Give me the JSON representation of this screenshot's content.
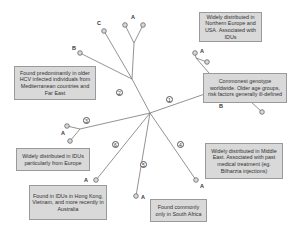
{
  "diagram": {
    "type": "phylogenetic-tree",
    "colors": {
      "line": "#777777",
      "node_stroke": "#666666",
      "node_fill": "#d9d9d9",
      "box_fill": "#d9d9d9",
      "box_border": "#9a9a9a"
    },
    "genotypes": [
      {
        "number": "1",
        "subtypes": [
          "A",
          "B"
        ],
        "descriptions": [
          "Widely distributed in Northern Europe and USA. Associated with IDUs",
          "Commonest genotype worldwide. Older age groups, risk factors generally ill-defined"
        ]
      },
      {
        "number": "2",
        "subtypes": [
          "A",
          "B",
          "C"
        ],
        "descriptions": [
          "Found predominantly in older HCV infected individuals from Mediterranean countries and Far East"
        ]
      },
      {
        "number": "3",
        "subtypes": [
          "A"
        ],
        "descriptions": [
          "Widely distributed in IDUs particularly from Europe"
        ]
      },
      {
        "number": "4",
        "subtypes": [
          "A"
        ],
        "descriptions": [
          "Widely distributed in Middle East. Associated with past medical treatment (eg. Bilharzia injections)"
        ]
      },
      {
        "number": "5",
        "subtypes": [
          "A"
        ],
        "descriptions": [
          "Found commonly only in South Africa"
        ]
      },
      {
        "number": "6",
        "subtypes": [
          "A"
        ],
        "descriptions": [
          "Found in IDUs in Hong Kong, Vietnam, and more recently in Australia"
        ]
      }
    ]
  },
  "boxes": {
    "g1a": "Widely distributed in Northern Europe and USA. Associated with IDUs",
    "g1b": "Commonest genotype worldwide. Older age groups, risk factors generally ill-defined",
    "g2": "Found predominantly in older HCV infected individuals from Mediterranean countries and Far East",
    "g3": "Widely distributed in IDUs particularly from Europe",
    "g4": "Widely distributed in Middle East. Associated with past medical treatment (eg. Bilharzia injections)",
    "g5": "Found commonly only in South Africa",
    "g6": "Found in IDUs in Hong Kong, Vietnam, and more recently in Australia"
  },
  "numbers": {
    "n1": "1",
    "n2": "2",
    "n3": "3",
    "n4": "4",
    "n5": "5",
    "n6": "6"
  },
  "labels": {
    "A": "A",
    "B": "B",
    "C": "C"
  }
}
